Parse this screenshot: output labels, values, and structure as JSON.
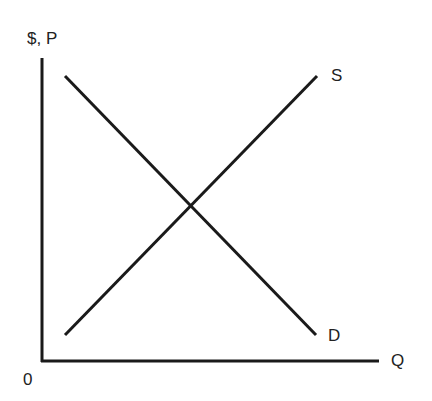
{
  "diagram": {
    "title": "",
    "y_axis_label": "$, P",
    "x_axis_label": "Q",
    "origin_label": "0",
    "curves": [
      {
        "name": "Supply",
        "label": "S"
      },
      {
        "name": "Demand",
        "label": "D"
      }
    ],
    "line_color": "#1a1a1a"
  }
}
